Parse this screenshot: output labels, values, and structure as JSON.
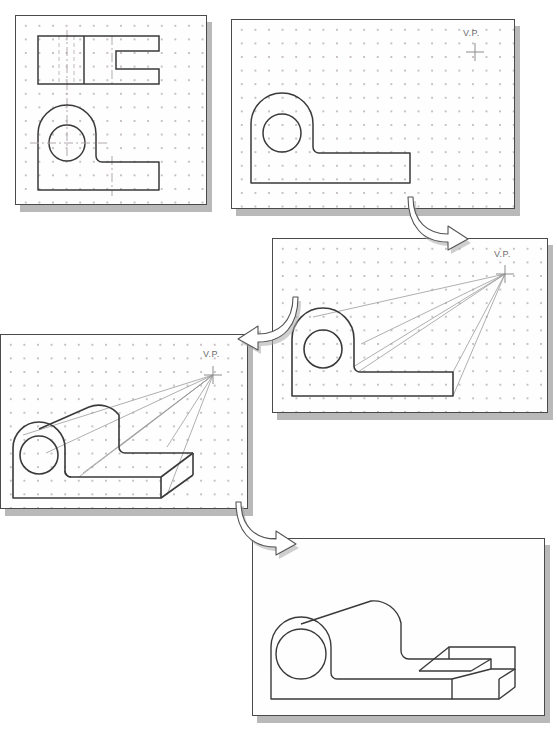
{
  "diagram": {
    "panel_count": 5,
    "arrow_count": 3,
    "colors": {
      "paper": "#fefefe",
      "panel_border": "#4a4a4a",
      "panel_shadow": "#b9b9b9",
      "grid_dot": "#c9bfc4",
      "object_line": "#3a3a3a",
      "construction_line": "#9a9a9a",
      "centerline": "#b0a8ae",
      "hidden_line": "#c0b8be",
      "vp_label_text": "#6d6d6d",
      "arrow_fill": "#ffffff",
      "arrow_stroke": "#555555",
      "arrow_shadow": "#a8a8a8"
    }
  },
  "panels": [
    {
      "id": "panel-1",
      "step": 1,
      "name": "orthographic-views",
      "caption": "",
      "has_grid": true,
      "has_vanishing_point": false,
      "vp_label": "",
      "features": [
        "top-view-rectangle",
        "slot-profile",
        "front-view-profile",
        "centerlines",
        "hidden-lines"
      ]
    },
    {
      "id": "panel-2",
      "step": 2,
      "name": "front-profile-with-vp",
      "caption": "",
      "has_grid": true,
      "has_vanishing_point": true,
      "vp_label": "V.P.",
      "features": [
        "front-view-profile",
        "vanishing-point-cross"
      ]
    },
    {
      "id": "panel-3",
      "step": 3,
      "name": "projection-lines-to-vp",
      "caption": "",
      "has_grid": true,
      "has_vanishing_point": true,
      "vp_label": "V.P.",
      "features": [
        "front-view-profile",
        "vanishing-point-cross",
        "receding-projection-lines"
      ]
    },
    {
      "id": "panel-4",
      "step": 4,
      "name": "depth-established",
      "caption": "",
      "has_grid": true,
      "has_vanishing_point": true,
      "vp_label": "V.P.",
      "features": [
        "three-dimensional-form",
        "receding-projection-lines",
        "vanishing-point-cross",
        "back-edges"
      ]
    },
    {
      "id": "panel-5",
      "step": 5,
      "name": "completed-perspective",
      "caption": "",
      "has_grid": false,
      "has_vanishing_point": false,
      "vp_label": "",
      "features": [
        "finished-object",
        "hidden-lines-removed",
        "notch-detail"
      ]
    }
  ],
  "arrows": [
    {
      "id": "arrow-1",
      "name": "arrow-step1-to-step3",
      "direction": "down-right",
      "from_panel": "panel-2",
      "to_panel": "panel-3"
    },
    {
      "id": "arrow-2",
      "name": "arrow-step3-to-step4",
      "direction": "down-left",
      "from_panel": "panel-3",
      "to_panel": "panel-4"
    },
    {
      "id": "arrow-3",
      "name": "arrow-step4-to-step5",
      "direction": "down-right",
      "from_panel": "panel-4",
      "to_panel": "panel-5"
    }
  ]
}
